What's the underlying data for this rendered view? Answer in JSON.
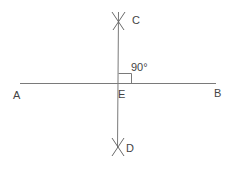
{
  "diagram": {
    "points": {
      "A": {
        "label": "A"
      },
      "B": {
        "label": "B"
      },
      "C": {
        "label": "C"
      },
      "D": {
        "label": "D"
      },
      "E": {
        "label": "E"
      }
    },
    "angle_label": "90°",
    "colors": {
      "line": "#7a7a7a",
      "text": "#444444",
      "background": "#ffffff"
    }
  }
}
